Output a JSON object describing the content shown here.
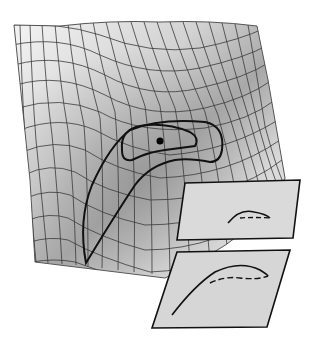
{
  "diagram": {
    "type": "3d-surface-with-projections",
    "background": "#ffffff",
    "surface": {
      "fill_light": "#f2f2f2",
      "fill_dark": "#9a9a9a",
      "mesh_color": "#3a3a3a",
      "mesh_rows": 14,
      "mesh_cols": 20
    },
    "contours": [
      {
        "name": "outer-contour",
        "color": "#111111"
      },
      {
        "name": "inner-contour",
        "color": "#111111"
      }
    ],
    "marker": {
      "name": "optimum-point",
      "color": "#000000",
      "x": 160,
      "y": 141
    },
    "panels": [
      {
        "name": "upper-projection-panel",
        "fill": "#d9d9d9",
        "curve": "small-arc-solid-and-dashed"
      },
      {
        "name": "lower-projection-panel",
        "fill": "#d4d4d4",
        "curve": "large-arc-solid-and-dashed"
      }
    ]
  }
}
